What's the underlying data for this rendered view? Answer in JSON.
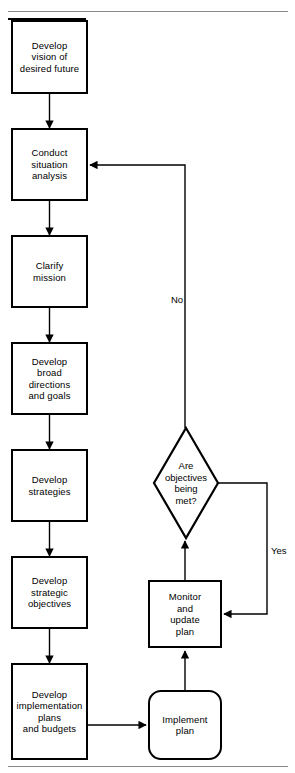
{
  "figure": {
    "title_fragment": "",
    "top_rule": true,
    "bottom_rule": true,
    "background_color": "#ffffff",
    "line_color": "#000000",
    "text_color": "#000000"
  },
  "nodes": [
    {
      "id": "develop-vision",
      "shape": "rectangle",
      "label": "Develop\nvision of\ndesired future"
    },
    {
      "id": "conduct-situation",
      "shape": "rectangle",
      "label": "Conduct\nsituation\nanalysis"
    },
    {
      "id": "clarify-mission",
      "shape": "rectangle",
      "label": "Clarify\nmission"
    },
    {
      "id": "develop-broad",
      "shape": "rectangle",
      "label": "Develop\nbroad\ndirections\nand goals"
    },
    {
      "id": "develop-strategies",
      "shape": "rectangle",
      "label": "Develop\nstrategies"
    },
    {
      "id": "develop-objectives",
      "shape": "rectangle",
      "label": "Develop\nstrategic\nobjectives"
    },
    {
      "id": "develop-implementation",
      "shape": "rectangle",
      "label": "Develop\nimplementation\nplans\nand budgets"
    },
    {
      "id": "implement-plan",
      "shape": "rounded",
      "label": "Implement\nplan"
    },
    {
      "id": "monitor-update",
      "shape": "rectangle",
      "label": "Monitor\nand\nupdate\nplan"
    },
    {
      "id": "are-objectives-met",
      "shape": "diamond",
      "label": "Are\nobjectives\nbeing\nmet?"
    }
  ],
  "edge_labels": {
    "no": "No",
    "yes": "Yes"
  },
  "edges": [
    {
      "from": "develop-vision",
      "to": "conduct-situation",
      "label": ""
    },
    {
      "from": "conduct-situation",
      "to": "clarify-mission",
      "label": ""
    },
    {
      "from": "clarify-mission",
      "to": "develop-broad",
      "label": ""
    },
    {
      "from": "develop-broad",
      "to": "develop-strategies",
      "label": ""
    },
    {
      "from": "develop-strategies",
      "to": "develop-objectives",
      "label": ""
    },
    {
      "from": "develop-objectives",
      "to": "develop-implementation",
      "label": ""
    },
    {
      "from": "develop-implementation",
      "to": "implement-plan",
      "label": ""
    },
    {
      "from": "implement-plan",
      "to": "monitor-update",
      "label": ""
    },
    {
      "from": "monitor-update",
      "to": "are-objectives-met",
      "label": ""
    },
    {
      "from": "are-objectives-met",
      "to": "conduct-situation",
      "label": "No"
    },
    {
      "from": "are-objectives-met",
      "to": "monitor-update",
      "label": "Yes"
    }
  ]
}
